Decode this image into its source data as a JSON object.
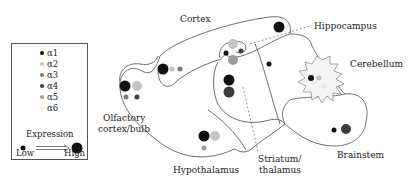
{
  "legend": {
    "subunits": [
      {
        "label": "α1",
        "color": "#111111"
      },
      {
        "label": "α2",
        "color": "#c4c4c4"
      },
      {
        "label": "α3",
        "color": "#7a7a7a"
      },
      {
        "label": "α4",
        "color": "#3c3c3c"
      },
      {
        "label": "α5",
        "color": "#9c9c9c"
      },
      {
        "label": "α6",
        "color": "#ebebeb"
      }
    ],
    "expression_title": "Expression",
    "low_label": "Low",
    "high_label": "High"
  },
  "regions": {
    "cortex": "Cortex",
    "hippocampus": "Hippocampus",
    "cerebellum": "Cerebellum",
    "olfactory_line1": "Olfactory",
    "olfactory_line2": "cortex/bulb",
    "hypothalamus": "Hypothalamus",
    "striatum_line1": "Striatum/",
    "striatum_line2": "thalamus",
    "brainstem": "Brainstem"
  },
  "expression_dots": [
    {
      "region": "olfactory",
      "subunit": "α1",
      "x": 125,
      "y": 86,
      "r": 5.5
    },
    {
      "region": "olfactory",
      "subunit": "α2",
      "x": 137,
      "y": 86,
      "r": 5
    },
    {
      "region": "olfactory",
      "subunit": "α3",
      "x": 126,
      "y": 97,
      "r": 2.5
    },
    {
      "region": "olfactory",
      "subunit": "α4",
      "x": 137,
      "y": 97,
      "r": 2.5
    },
    {
      "region": "cortex",
      "subunit": "α1",
      "x": 163,
      "y": 69,
      "r": 5.5
    },
    {
      "region": "cortex",
      "subunit": "α2",
      "x": 172,
      "y": 69,
      "r": 2.5
    },
    {
      "region": "cortex",
      "subunit": "α3",
      "x": 180,
      "y": 69,
      "r": 2.5
    },
    {
      "region": "cortex",
      "subunit": "α1",
      "x": 279,
      "y": 27,
      "r": 5.5
    },
    {
      "region": "hippocampus",
      "subunit": "α2",
      "x": 233,
      "y": 44,
      "r": 5
    },
    {
      "region": "hippocampus",
      "subunit": "α1",
      "x": 226,
      "y": 53,
      "r": 2.5
    },
    {
      "region": "hippocampus",
      "subunit": "α4",
      "x": 241,
      "y": 51,
      "r": 2.5
    },
    {
      "region": "hippocampus",
      "subunit": "α5",
      "x": 233,
      "y": 60,
      "r": 5
    },
    {
      "region": "striatum",
      "subunit": "α1",
      "x": 229,
      "y": 80,
      "r": 5.5
    },
    {
      "region": "striatum",
      "subunit": "α4",
      "x": 229,
      "y": 92,
      "r": 5.5
    },
    {
      "region": "thalamus",
      "subunit": "α1",
      "x": 269,
      "y": 64,
      "r": 2.5
    },
    {
      "region": "cerebellum",
      "subunit": "α1",
      "x": 311,
      "y": 78,
      "r": 3
    },
    {
      "region": "cerebellum",
      "subunit": "α2",
      "x": 319,
      "y": 78,
      "r": 2.5
    },
    {
      "region": "cerebellum",
      "subunit": "α6",
      "x": 324,
      "y": 86,
      "r": 3
    },
    {
      "region": "hypothalamus",
      "subunit": "α1",
      "x": 204,
      "y": 136,
      "r": 5.5
    },
    {
      "region": "hypothalamus",
      "subunit": "α2",
      "x": 215,
      "y": 136,
      "r": 5
    },
    {
      "region": "hypothalamus",
      "subunit": "α5",
      "x": 204,
      "y": 148,
      "r": 2.5
    },
    {
      "region": "brainstem",
      "subunit": "α1",
      "x": 334,
      "y": 130,
      "r": 2.5
    },
    {
      "region": "brainstem",
      "subunit": "α4",
      "x": 346,
      "y": 129,
      "r": 5
    }
  ]
}
